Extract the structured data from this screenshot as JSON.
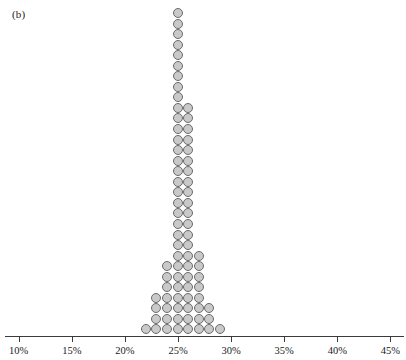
{
  "figure": {
    "panel_label": "(b)",
    "background_color": "#ffffff"
  },
  "style": {
    "dot_fill": "#c9c9c9",
    "dot_stroke": "#6b6b6b",
    "axis_color": "#3a3a3a",
    "text_color": "#1a1a1a"
  },
  "axis": {
    "tick_labels": [
      "10%",
      "15%",
      "20%",
      "25%",
      "30%",
      "35%",
      "40%",
      "45%"
    ],
    "tick_values": [
      10,
      15,
      20,
      25,
      30,
      35,
      40,
      45
    ],
    "min": 10,
    "max": 45,
    "step": 5
  },
  "chart_data": {
    "type": "bar",
    "plot_style": "dot-plot",
    "title": "",
    "subtitle": "",
    "xlabel": "",
    "ylabel": "",
    "xlim": [
      9,
      46
    ],
    "ylim": [
      0,
      31
    ],
    "grid": false,
    "legend": null,
    "annotations": [
      "(b)"
    ],
    "bin_width": 1,
    "unit": "percent",
    "dot_value": 1,
    "categories": [
      "22%",
      "23%",
      "24%",
      "25%",
      "26%",
      "27%",
      "28%",
      "29%"
    ],
    "x": [
      22,
      23,
      24,
      25,
      26,
      27,
      28,
      29
    ],
    "values": [
      1,
      4,
      7,
      31,
      22,
      8,
      3,
      1
    ],
    "total_dots": 77,
    "mode": "25%",
    "series": [
      {
        "name": "count",
        "values": [
          1,
          4,
          7,
          31,
          22,
          8,
          3,
          1
        ]
      }
    ]
  }
}
